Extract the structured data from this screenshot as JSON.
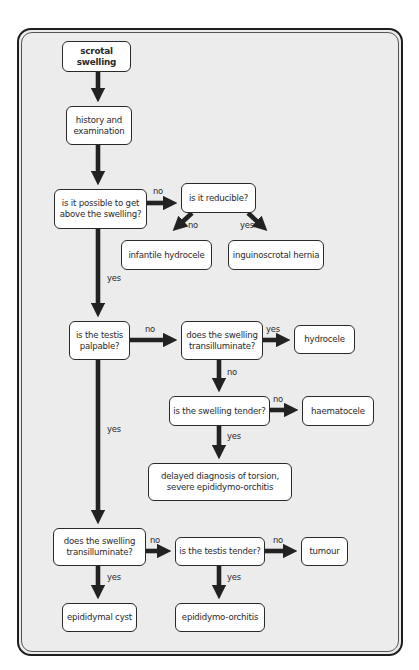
{
  "flowchart": {
    "nodes": {
      "scrotal_swelling": "scrotal swelling",
      "history": "history and examination",
      "above_swelling": "is it possible to get above the swelling?",
      "reducible": "is it reducible?",
      "infantile_hydrocele": "infantile hydrocele",
      "inguinoscrotal_hernia": "inguinoscrotal hernia",
      "testis_palpable": "is the testis palpable?",
      "transilluminate_1": "does the swelling transilluminate?",
      "hydrocele": "hydrocele",
      "swelling_tender": "is the swelling tender?",
      "haematocele": "haematocele",
      "delayed_diagnosis": "delayed diagnosis of torsion, severe epididymo-orchitis",
      "transilluminate_2": "does the swelling transilluminate?",
      "testis_tender": "is the testis tender?",
      "tumour": "tumour",
      "epididymal_cyst": "epididymal cyst",
      "epididymo_orchitis": "epididymo-orchitis"
    },
    "edge_labels": {
      "above_to_reducible": "no",
      "above_to_palpable": "yes",
      "reducible_to_infantile": "no",
      "reducible_to_hernia": "yes",
      "palpable_to_transillum1": "no",
      "palpable_to_transillum2": "yes",
      "transillum1_to_hydrocele": "yes",
      "transillum1_to_tender": "no",
      "tender_to_haematocele": "no",
      "tender_to_delayed": "yes",
      "transillum2_to_testis_tender": "no",
      "transillum2_to_cyst": "yes",
      "testis_tender_to_tumour": "no",
      "testis_tender_to_orchitis": "yes"
    },
    "colors": {
      "arrow": "#222222",
      "panel": "#ebebeb",
      "box": "#ffffff"
    }
  }
}
